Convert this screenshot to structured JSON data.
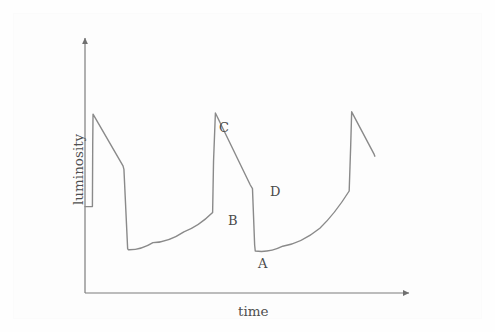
{
  "figure": {
    "background_color": "#fefefe",
    "plate_color": "#fdfdfd",
    "width": 495,
    "height": 332
  },
  "axes": {
    "x_label": "time",
    "y_label": "luminosity",
    "line_color": "#7d7d7d",
    "origin": [
      85,
      293
    ],
    "x_arrow_tip": [
      412,
      293
    ],
    "y_arrow_tip": [
      85,
      35
    ],
    "x_label_pos": [
      238,
      309
    ],
    "y_label_pos": [
      70,
      197
    ]
  },
  "curve": {
    "color": "#8a8a8a",
    "width": 1.4
  },
  "annotations": [
    {
      "id": "label-a",
      "text": "A",
      "x": 258,
      "y": 257
    },
    {
      "id": "label-b",
      "text": "B",
      "x": 228,
      "y": 214
    },
    {
      "id": "label-c",
      "text": "C",
      "x": 219,
      "y": 121
    },
    {
      "id": "label-d",
      "text": "D",
      "x": 270,
      "y": 185
    }
  ],
  "chart_data": {
    "type": "line",
    "title": "",
    "subtitle": "",
    "xlabel": "time",
    "ylabel": "luminosity",
    "grid": false,
    "legend": null,
    "axis_ticks": {
      "x": [],
      "y": []
    },
    "axis_arrows": {
      "x": true,
      "y": true
    },
    "xlim": [
      0,
      100
    ],
    "ylim": [
      0,
      100
    ],
    "series": [
      {
        "name": "luminosity",
        "units": "arbitrary",
        "points": [
          {
            "x": 0.0,
            "y": 36.0,
            "note": "start of trace"
          },
          {
            "x": 2.4,
            "y": 36.0
          },
          {
            "x": 2.5,
            "y": 62.0
          },
          {
            "x": 2.6,
            "y": 74.5,
            "note": "peak 1 maximum"
          },
          {
            "x": 12.3,
            "y": 53.0
          },
          {
            "x": 12.6,
            "y": 51.5
          },
          {
            "x": 13.8,
            "y": 18.5
          },
          {
            "x": 14.0,
            "y": 18.0,
            "note": "minimum 1"
          },
          {
            "x": 22.0,
            "y": 21.0
          },
          {
            "x": 32.0,
            "y": 25.5
          },
          {
            "x": 41.3,
            "y": 33.5,
            "note": "point B"
          },
          {
            "x": 41.6,
            "y": 55.0
          },
          {
            "x": 42.2,
            "y": 75.0,
            "note": "point C, peak 2 maximum"
          },
          {
            "x": 53.5,
            "y": 45.0
          },
          {
            "x": 54.2,
            "y": 43.5,
            "note": "point D"
          },
          {
            "x": 54.9,
            "y": 20.0
          },
          {
            "x": 55.1,
            "y": 17.5,
            "note": "point A, minimum 2"
          },
          {
            "x": 64.0,
            "y": 19.5
          },
          {
            "x": 76.0,
            "y": 27.0
          },
          {
            "x": 85.5,
            "y": 42.5
          },
          {
            "x": 86.0,
            "y": 62.0
          },
          {
            "x": 86.3,
            "y": 75.5,
            "note": "peak 3 maximum"
          },
          {
            "x": 93.5,
            "y": 58.0
          },
          {
            "x": 93.8,
            "y": 57.0,
            "note": "trace ends"
          }
        ]
      }
    ],
    "labeled_points": [
      {
        "label": "A",
        "x": 55.1,
        "y": 17.5,
        "meaning": "minimum following abrupt drop from D"
      },
      {
        "label": "B",
        "x": 41.3,
        "y": 33.5,
        "meaning": "base of fast rise toward maximum C"
      },
      {
        "label": "C",
        "x": 42.2,
        "y": 75.0,
        "meaning": "outburst maximum luminosity"
      },
      {
        "label": "D",
        "x": 54.2,
        "y": 43.5,
        "meaning": "end of linear decline before abrupt drop"
      }
    ]
  }
}
